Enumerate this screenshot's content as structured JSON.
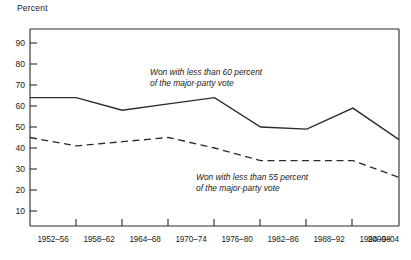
{
  "chart_data": {
    "type": "line",
    "title": "",
    "ylabel": "Percent",
    "xlabel": "",
    "ylim": [
      0,
      95
    ],
    "yticks": [
      10,
      20,
      30,
      40,
      50,
      60,
      70,
      80,
      90
    ],
    "grid": false,
    "legend_position": "inline-annotation",
    "categories": [
      "1952–56",
      "1958–62",
      "1964–68",
      "1970–74",
      "1976–80",
      "1982–86",
      "1988–92",
      "1994–98",
      "2000–04"
    ],
    "series": [
      {
        "name": "Won with less than 60 percent of the major-party vote",
        "style": "solid",
        "values": [
          64,
          64,
          58,
          61,
          64,
          50,
          49,
          59,
          44
        ]
      },
      {
        "name": "Won with less than 55 percent of the major-party vote",
        "style": "dashed",
        "values": [
          45,
          41,
          43,
          45,
          40,
          34,
          34,
          34,
          26
        ]
      }
    ],
    "annotations": [
      {
        "id": "annotation-solid",
        "line1": "Won with less than 60 percent",
        "line2": "of the major-party vote",
        "x": 150,
        "y": 75
      },
      {
        "id": "annotation-dashed",
        "line1": "Won with less than 55 percent",
        "line2": "of the major-party vote",
        "x": 196,
        "y": 178
      }
    ]
  },
  "axis": {
    "y_label": "Percent",
    "y_tick_labels": [
      "90",
      "80",
      "70",
      "60",
      "50",
      "40",
      "30",
      "20",
      "10"
    ],
    "x_tick_labels": [
      "1952–56",
      "1958–62",
      "1964–68",
      "1970–74",
      "1976–80",
      "1982–86",
      "1988–92",
      "1994–98",
      "2000–04"
    ]
  },
  "annotations": {
    "solid": {
      "line1": "Won with less than 60 percent",
      "line2": "of the major-party vote"
    },
    "dashed": {
      "line1": "Won with less than 55 percent",
      "line2": "of the major-party vote"
    }
  },
  "colors": {
    "ink": "#2b2b2b",
    "background": "#ffffff"
  }
}
